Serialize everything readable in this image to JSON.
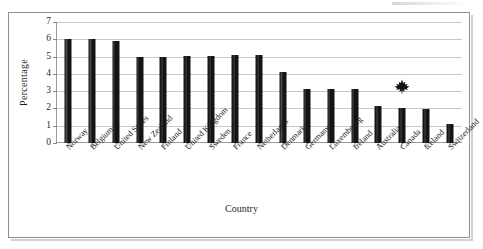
{
  "chart_data": {
    "type": "bar",
    "title": "",
    "xlabel": "Country",
    "ylabel": "Percentage",
    "ylim": [
      0,
      7
    ],
    "yticks": [
      0,
      1,
      2,
      3,
      4,
      5,
      6,
      7
    ],
    "grid": true,
    "legend": null,
    "bar_color": "#141414",
    "categories": [
      "Norway",
      "Belgium",
      "United States",
      "New Zealand",
      "Finland",
      "United Kingdom",
      "Sweden",
      "France",
      "Netherlands",
      "Denmark",
      "Germany",
      "Luxembourg",
      "Ireland",
      "Australia",
      "Canada",
      "Iceland",
      "Switzerland"
    ],
    "values": [
      6.0,
      6.0,
      5.9,
      5.0,
      5.0,
      5.05,
      5.05,
      5.1,
      5.1,
      4.1,
      3.1,
      3.1,
      3.15,
      2.15,
      2.05,
      1.95,
      1.1
    ],
    "annotations": [
      {
        "name": "maple-leaf-marker",
        "category": "Canada",
        "value": 3.25,
        "symbol": "maple-leaf",
        "color": "#141414"
      }
    ]
  }
}
